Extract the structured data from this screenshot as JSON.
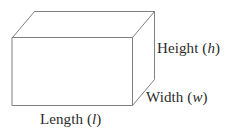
{
  "figure": {
    "kind": "rectangular-prism-diagram",
    "background_color": "#ffffff",
    "line_color": "#808080",
    "text_color": "#2b2b2b",
    "line_width": 1
  },
  "labels": {
    "height": {
      "word": "Height",
      "open_paren": "(",
      "variable": "h",
      "close_paren": ")"
    },
    "width": {
      "word": "Width",
      "open_paren": "(",
      "variable": "w",
      "close_paren": ")"
    },
    "length": {
      "word": "Length",
      "open_paren": "(",
      "variable": "l",
      "close_paren": ")"
    }
  },
  "geometry": {
    "front_face": [
      [
        12,
        37
      ],
      [
        132,
        37
      ],
      [
        132,
        105
      ],
      [
        12,
        105
      ]
    ],
    "back_top_left": [
      34,
      11
    ],
    "back_top_right": [
      154,
      11
    ],
    "back_bottom_right": [
      154,
      79
    ],
    "depth_offset": [
      22,
      -26
    ]
  }
}
